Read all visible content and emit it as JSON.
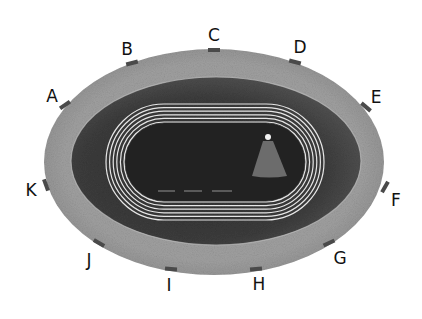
{
  "diagram": {
    "colors": {
      "background": "#ffffff",
      "outer_ring": "#9a9a9a",
      "inner_bowl": "#3a3a3a",
      "field": "#262626",
      "track_lines": "#e8e8e8",
      "gate_marker": "#4a4a4a",
      "throwing_sector": "#6e6e6e",
      "label": "#111111"
    },
    "track_lane_lines": 6,
    "gates": [
      {
        "label": "A",
        "x": 52,
        "y": 96,
        "mx": 65,
        "my": 105,
        "angle": -35
      },
      {
        "label": "B",
        "x": 127,
        "y": 49,
        "mx": 132,
        "my": 63,
        "angle": -15
      },
      {
        "label": "C",
        "x": 214,
        "y": 35,
        "mx": 214,
        "my": 50,
        "angle": 0
      },
      {
        "label": "D",
        "x": 300,
        "y": 47,
        "mx": 295,
        "my": 62,
        "angle": 15
      },
      {
        "label": "E",
        "x": 376,
        "y": 97,
        "mx": 366,
        "my": 107,
        "angle": 40
      },
      {
        "label": "F",
        "x": 396,
        "y": 200,
        "mx": 385,
        "my": 187,
        "angle": -60
      },
      {
        "label": "G",
        "x": 340,
        "y": 258,
        "mx": 329,
        "my": 243,
        "angle": -25
      },
      {
        "label": "H",
        "x": 259,
        "y": 284,
        "mx": 256,
        "my": 269,
        "angle": -5
      },
      {
        "label": "I",
        "x": 169,
        "y": 285,
        "mx": 171,
        "my": 269,
        "angle": 5
      },
      {
        "label": "J",
        "x": 89,
        "y": 260,
        "mx": 99,
        "my": 243,
        "angle": 30
      },
      {
        "label": "K",
        "x": 31,
        "y": 190,
        "mx": 46,
        "my": 185,
        "angle": 70
      }
    ]
  }
}
